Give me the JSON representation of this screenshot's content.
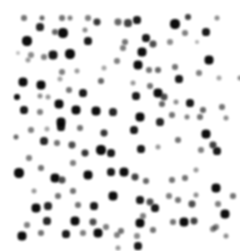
{
  "image": {
    "width": 240,
    "height": 251,
    "background": "#ffffff",
    "dot_color": "#000000",
    "description": "Scattered blurred dark dots on a white background"
  },
  "dots": [
    {
      "x": 24,
      "y": 18,
      "s": 6,
      "o": 0.55,
      "k": "light"
    },
    {
      "x": 42,
      "y": 18,
      "s": 5,
      "o": 0.6,
      "k": "light"
    },
    {
      "x": 62,
      "y": 18,
      "s": 6,
      "o": 0.55,
      "k": "light"
    },
    {
      "x": 70,
      "y": 18,
      "s": 5,
      "o": 0.5,
      "k": "light"
    },
    {
      "x": 40,
      "y": 27,
      "s": 8,
      "o": 0.85,
      "k": "dark"
    },
    {
      "x": 55,
      "y": 32,
      "s": 6,
      "o": 0.6,
      "k": "mid"
    },
    {
      "x": 63,
      "y": 33,
      "s": 10,
      "o": 0.95,
      "k": "dark"
    },
    {
      "x": 27,
      "y": 41,
      "s": 10,
      "o": 0.95,
      "k": "dark"
    },
    {
      "x": 18,
      "y": 53,
      "s": 4,
      "o": 0.25,
      "k": "light"
    },
    {
      "x": 31,
      "y": 55,
      "s": 6,
      "o": 0.45,
      "k": "mid"
    },
    {
      "x": 28,
      "y": 60,
      "s": 5,
      "o": 0.4,
      "k": "light"
    },
    {
      "x": 44,
      "y": 57,
      "s": 6,
      "o": 0.5,
      "k": "mid"
    },
    {
      "x": 53,
      "y": 55,
      "s": 9,
      "o": 0.9,
      "k": "dark"
    },
    {
      "x": 70,
      "y": 54,
      "s": 10,
      "o": 0.95,
      "k": "dark"
    },
    {
      "x": 62,
      "y": 72,
      "s": 6,
      "o": 0.5,
      "k": "mid"
    },
    {
      "x": 77,
      "y": 71,
      "s": 5,
      "o": 0.4,
      "k": "light"
    },
    {
      "x": 60,
      "y": 79,
      "s": 5,
      "o": 0.35,
      "k": "light"
    },
    {
      "x": 23,
      "y": 82,
      "s": 9,
      "o": 0.95,
      "k": "dark"
    },
    {
      "x": 41,
      "y": 85,
      "s": 9,
      "o": 0.95,
      "k": "dark"
    },
    {
      "x": 69,
      "y": 90,
      "s": 6,
      "o": 0.55,
      "k": "mid"
    },
    {
      "x": 17,
      "y": 97,
      "s": 6,
      "o": 0.95,
      "k": "dark"
    },
    {
      "x": 40,
      "y": 96,
      "s": 5,
      "o": 0.45,
      "k": "light"
    },
    {
      "x": 48,
      "y": 97,
      "s": 5,
      "o": 0.4,
      "k": "light"
    },
    {
      "x": 59,
      "y": 104,
      "s": 9,
      "o": 0.95,
      "k": "dark"
    },
    {
      "x": 83,
      "y": 93,
      "s": 8,
      "o": 0.9,
      "k": "dark"
    },
    {
      "x": 101,
      "y": 81,
      "s": 6,
      "o": 0.6,
      "k": "mid"
    },
    {
      "x": 24,
      "y": 110,
      "s": 8,
      "o": 0.9,
      "k": "dark"
    },
    {
      "x": 40,
      "y": 112,
      "s": 6,
      "o": 0.5,
      "k": "mid"
    },
    {
      "x": 61,
      "y": 122,
      "s": 9,
      "o": 0.95,
      "k": "dark"
    },
    {
      "x": 76,
      "y": 110,
      "s": 9,
      "o": 0.95,
      "k": "dark"
    },
    {
      "x": 96,
      "y": 111,
      "s": 9,
      "o": 0.95,
      "k": "dark"
    },
    {
      "x": 113,
      "y": 112,
      "s": 8,
      "o": 0.85,
      "k": "dark"
    },
    {
      "x": 88,
      "y": 18,
      "s": 6,
      "o": 0.5,
      "k": "mid"
    },
    {
      "x": 97,
      "y": 22,
      "s": 7,
      "o": 0.8,
      "k": "dark"
    },
    {
      "x": 118,
      "y": 22,
      "s": 7,
      "o": 0.6,
      "k": "mid"
    },
    {
      "x": 128,
      "y": 23,
      "s": 8,
      "o": 0.75,
      "k": "mid"
    },
    {
      "x": 137,
      "y": 20,
      "s": 8,
      "o": 0.9,
      "k": "dark"
    },
    {
      "x": 85,
      "y": 30,
      "s": 5,
      "o": 0.45,
      "k": "light"
    },
    {
      "x": 88,
      "y": 41,
      "s": 8,
      "o": 0.9,
      "k": "dark"
    },
    {
      "x": 125,
      "y": 42,
      "s": 6,
      "o": 0.55,
      "k": "mid"
    },
    {
      "x": 123,
      "y": 48,
      "s": 6,
      "o": 0.5,
      "k": "mid"
    },
    {
      "x": 146,
      "y": 38,
      "s": 8,
      "o": 0.9,
      "k": "dark"
    },
    {
      "x": 153,
      "y": 44,
      "s": 7,
      "o": 0.7,
      "k": "mid"
    },
    {
      "x": 142,
      "y": 52,
      "s": 9,
      "o": 0.95,
      "k": "dark"
    },
    {
      "x": 138,
      "y": 65,
      "s": 9,
      "o": 0.95,
      "k": "dark"
    },
    {
      "x": 117,
      "y": 61,
      "s": 6,
      "o": 0.5,
      "k": "mid"
    },
    {
      "x": 104,
      "y": 68,
      "s": 5,
      "o": 0.35,
      "k": "light"
    },
    {
      "x": 149,
      "y": 70,
      "s": 6,
      "o": 0.55,
      "k": "mid"
    },
    {
      "x": 158,
      "y": 70,
      "s": 6,
      "o": 0.6,
      "k": "mid"
    },
    {
      "x": 175,
      "y": 24,
      "s": 10,
      "o": 0.95,
      "k": "dark"
    },
    {
      "x": 188,
      "y": 17,
      "s": 6,
      "o": 0.75,
      "k": "dark"
    },
    {
      "x": 185,
      "y": 33,
      "s": 6,
      "o": 0.5,
      "k": "mid"
    },
    {
      "x": 206,
      "y": 32,
      "s": 8,
      "o": 0.9,
      "k": "dark"
    },
    {
      "x": 217,
      "y": 18,
      "s": 5,
      "o": 0.45,
      "k": "light"
    },
    {
      "x": 170,
      "y": 42,
      "s": 6,
      "o": 0.45,
      "k": "mid"
    },
    {
      "x": 197,
      "y": 42,
      "s": 4,
      "o": 0.3,
      "k": "light"
    },
    {
      "x": 209,
      "y": 60,
      "s": 9,
      "o": 0.95,
      "k": "dark"
    },
    {
      "x": 175,
      "y": 67,
      "s": 6,
      "o": 0.55,
      "k": "mid"
    },
    {
      "x": 199,
      "y": 73,
      "s": 6,
      "o": 0.5,
      "k": "mid"
    },
    {
      "x": 219,
      "y": 78,
      "s": 5,
      "o": 0.35,
      "k": "light"
    },
    {
      "x": 179,
      "y": 79,
      "s": 8,
      "o": 0.9,
      "k": "dark"
    },
    {
      "x": 240,
      "y": 78,
      "s": 5,
      "o": 0.45,
      "k": "light"
    },
    {
      "x": 133,
      "y": 83,
      "s": 5,
      "o": 0.4,
      "k": "light"
    },
    {
      "x": 150,
      "y": 86,
      "s": 6,
      "o": 0.55,
      "k": "mid"
    },
    {
      "x": 158,
      "y": 93,
      "s": 9,
      "o": 0.95,
      "k": "dark"
    },
    {
      "x": 164,
      "y": 97,
      "s": 7,
      "o": 0.7,
      "k": "mid"
    },
    {
      "x": 136,
      "y": 96,
      "s": 8,
      "o": 0.9,
      "k": "dark"
    },
    {
      "x": 162,
      "y": 104,
      "s": 6,
      "o": 0.6,
      "k": "mid"
    },
    {
      "x": 176,
      "y": 102,
      "s": 5,
      "o": 0.45,
      "k": "light"
    },
    {
      "x": 190,
      "y": 103,
      "s": 8,
      "o": 0.9,
      "k": "dark"
    },
    {
      "x": 203,
      "y": 110,
      "s": 6,
      "o": 0.6,
      "k": "mid"
    },
    {
      "x": 222,
      "y": 107,
      "s": 6,
      "o": 0.55,
      "k": "mid"
    },
    {
      "x": 140,
      "y": 117,
      "s": 9,
      "o": 0.95,
      "k": "dark"
    },
    {
      "x": 172,
      "y": 115,
      "s": 6,
      "o": 0.55,
      "k": "mid"
    },
    {
      "x": 187,
      "y": 117,
      "s": 5,
      "o": 0.5,
      "k": "light"
    },
    {
      "x": 200,
      "y": 117,
      "s": 6,
      "o": 0.55,
      "k": "mid"
    },
    {
      "x": 226,
      "y": 118,
      "s": 5,
      "o": 0.45,
      "k": "light"
    },
    {
      "x": 160,
      "y": 122,
      "s": 8,
      "o": 0.85,
      "k": "dark"
    },
    {
      "x": 31,
      "y": 130,
      "s": 6,
      "o": 0.5,
      "k": "mid"
    },
    {
      "x": 47,
      "y": 129,
      "s": 5,
      "o": 0.35,
      "k": "light"
    },
    {
      "x": 61,
      "y": 127,
      "s": 8,
      "o": 0.9,
      "k": "dark"
    },
    {
      "x": 80,
      "y": 128,
      "s": 6,
      "o": 0.55,
      "k": "mid"
    },
    {
      "x": 104,
      "y": 133,
      "s": 7,
      "o": 0.8,
      "k": "dark"
    },
    {
      "x": 134,
      "y": 130,
      "s": 8,
      "o": 0.9,
      "k": "dark"
    },
    {
      "x": 206,
      "y": 134,
      "s": 9,
      "o": 0.95,
      "k": "dark"
    },
    {
      "x": 16,
      "y": 137,
      "s": 5,
      "o": 0.6,
      "k": "mid"
    },
    {
      "x": 44,
      "y": 141,
      "s": 8,
      "o": 0.85,
      "k": "dark"
    },
    {
      "x": 57,
      "y": 143,
      "s": 6,
      "o": 0.55,
      "k": "mid"
    },
    {
      "x": 72,
      "y": 145,
      "s": 7,
      "o": 0.7,
      "k": "mid"
    },
    {
      "x": 85,
      "y": 153,
      "s": 7,
      "o": 0.8,
      "k": "dark"
    },
    {
      "x": 101,
      "y": 150,
      "s": 10,
      "o": 0.95,
      "k": "dark"
    },
    {
      "x": 111,
      "y": 153,
      "s": 8,
      "o": 0.9,
      "k": "dark"
    },
    {
      "x": 141,
      "y": 149,
      "s": 8,
      "o": 0.9,
      "k": "dark"
    },
    {
      "x": 158,
      "y": 147,
      "s": 5,
      "o": 0.4,
      "k": "light"
    },
    {
      "x": 178,
      "y": 140,
      "s": 6,
      "o": 0.55,
      "k": "mid"
    },
    {
      "x": 201,
      "y": 150,
      "s": 6,
      "o": 0.5,
      "k": "mid"
    },
    {
      "x": 213,
      "y": 145,
      "s": 7,
      "o": 0.75,
      "k": "mid"
    },
    {
      "x": 217,
      "y": 151,
      "s": 8,
      "o": 0.9,
      "k": "dark"
    },
    {
      "x": 29,
      "y": 158,
      "s": 6,
      "o": 0.5,
      "k": "mid"
    },
    {
      "x": 73,
      "y": 163,
      "s": 6,
      "o": 0.5,
      "k": "mid"
    },
    {
      "x": 41,
      "y": 168,
      "s": 6,
      "o": 0.55,
      "k": "mid"
    },
    {
      "x": 19,
      "y": 173,
      "s": 10,
      "o": 0.95,
      "k": "dark"
    },
    {
      "x": 55,
      "y": 178,
      "s": 9,
      "o": 0.95,
      "k": "dark"
    },
    {
      "x": 62,
      "y": 180,
      "s": 7,
      "o": 0.7,
      "k": "mid"
    },
    {
      "x": 88,
      "y": 175,
      "s": 9,
      "o": 0.95,
      "k": "dark"
    },
    {
      "x": 111,
      "y": 172,
      "s": 8,
      "o": 0.9,
      "k": "dark"
    },
    {
      "x": 124,
      "y": 172,
      "s": 9,
      "o": 0.95,
      "k": "dark"
    },
    {
      "x": 135,
      "y": 177,
      "s": 7,
      "o": 0.75,
      "k": "mid"
    },
    {
      "x": 146,
      "y": 181,
      "s": 6,
      "o": 0.6,
      "k": "mid"
    },
    {
      "x": 172,
      "y": 180,
      "s": 6,
      "o": 0.55,
      "k": "mid"
    },
    {
      "x": 185,
      "y": 178,
      "s": 6,
      "o": 0.55,
      "k": "mid"
    },
    {
      "x": 196,
      "y": 170,
      "s": 5,
      "o": 0.4,
      "k": "light"
    },
    {
      "x": 216,
      "y": 188,
      "s": 9,
      "o": 0.95,
      "k": "dark"
    },
    {
      "x": 34,
      "y": 191,
      "s": 5,
      "o": 0.4,
      "k": "light"
    },
    {
      "x": 58,
      "y": 196,
      "s": 6,
      "o": 0.55,
      "k": "mid"
    },
    {
      "x": 73,
      "y": 191,
      "s": 6,
      "o": 0.55,
      "k": "mid"
    },
    {
      "x": 113,
      "y": 196,
      "s": 9,
      "o": 0.95,
      "k": "dark"
    },
    {
      "x": 140,
      "y": 200,
      "s": 8,
      "o": 0.9,
      "k": "dark"
    },
    {
      "x": 150,
      "y": 202,
      "s": 7,
      "o": 0.7,
      "k": "mid"
    },
    {
      "x": 169,
      "y": 196,
      "s": 6,
      "o": 0.5,
      "k": "mid"
    },
    {
      "x": 178,
      "y": 200,
      "s": 6,
      "o": 0.55,
      "k": "mid"
    },
    {
      "x": 196,
      "y": 195,
      "s": 5,
      "o": 0.45,
      "k": "light"
    },
    {
      "x": 233,
      "y": 196,
      "s": 6,
      "o": 0.55,
      "k": "mid"
    },
    {
      "x": 36,
      "y": 208,
      "s": 9,
      "o": 0.95,
      "k": "dark"
    },
    {
      "x": 48,
      "y": 206,
      "s": 8,
      "o": 0.85,
      "k": "dark"
    },
    {
      "x": 78,
      "y": 205,
      "s": 6,
      "o": 0.55,
      "k": "mid"
    },
    {
      "x": 94,
      "y": 206,
      "s": 8,
      "o": 0.9,
      "k": "dark"
    },
    {
      "x": 155,
      "y": 208,
      "s": 8,
      "o": 0.9,
      "k": "dark"
    },
    {
      "x": 192,
      "y": 204,
      "s": 7,
      "o": 0.7,
      "k": "mid"
    },
    {
      "x": 218,
      "y": 204,
      "s": 6,
      "o": 0.5,
      "k": "mid"
    },
    {
      "x": 225,
      "y": 214,
      "s": 9,
      "o": 0.95,
      "k": "dark"
    },
    {
      "x": 47,
      "y": 221,
      "s": 8,
      "o": 0.85,
      "k": "dark"
    },
    {
      "x": 75,
      "y": 221,
      "s": 9,
      "o": 0.95,
      "k": "dark"
    },
    {
      "x": 93,
      "y": 222,
      "s": 7,
      "o": 0.7,
      "k": "mid"
    },
    {
      "x": 106,
      "y": 227,
      "s": 6,
      "o": 0.5,
      "k": "mid"
    },
    {
      "x": 121,
      "y": 231,
      "s": 6,
      "o": 0.55,
      "k": "mid"
    },
    {
      "x": 140,
      "y": 223,
      "s": 9,
      "o": 0.95,
      "k": "dark"
    },
    {
      "x": 143,
      "y": 216,
      "s": 6,
      "o": 0.5,
      "k": "mid"
    },
    {
      "x": 173,
      "y": 222,
      "s": 6,
      "o": 0.55,
      "k": "mid"
    },
    {
      "x": 184,
      "y": 222,
      "s": 9,
      "o": 0.95,
      "k": "dark"
    },
    {
      "x": 194,
      "y": 221,
      "s": 7,
      "o": 0.75,
      "k": "mid"
    },
    {
      "x": 216,
      "y": 227,
      "s": 6,
      "o": 0.5,
      "k": "mid"
    },
    {
      "x": 27,
      "y": 225,
      "s": 6,
      "o": 0.5,
      "k": "mid"
    },
    {
      "x": 22,
      "y": 236,
      "s": 9,
      "o": 0.95,
      "k": "dark"
    },
    {
      "x": 41,
      "y": 233,
      "s": 6,
      "o": 0.55,
      "k": "mid"
    },
    {
      "x": 66,
      "y": 234,
      "s": 8,
      "o": 0.9,
      "k": "dark"
    },
    {
      "x": 83,
      "y": 233,
      "s": 6,
      "o": 0.5,
      "k": "mid"
    },
    {
      "x": 98,
      "y": 233,
      "s": 9,
      "o": 0.95,
      "k": "dark"
    },
    {
      "x": 117,
      "y": 235,
      "s": 6,
      "o": 0.5,
      "k": "mid"
    },
    {
      "x": 137,
      "y": 236,
      "s": 6,
      "o": 0.45,
      "k": "mid"
    },
    {
      "x": 118,
      "y": 248,
      "s": 5,
      "o": 0.4,
      "k": "light"
    },
    {
      "x": 138,
      "y": 246,
      "s": 8,
      "o": 0.9,
      "k": "dark"
    },
    {
      "x": 153,
      "y": 230,
      "s": 6,
      "o": 0.55,
      "k": "mid"
    },
    {
      "x": 226,
      "y": 236,
      "s": 5,
      "o": 0.45,
      "k": "light"
    },
    {
      "x": 213,
      "y": 229,
      "s": 6,
      "o": 0.5,
      "k": "mid"
    }
  ]
}
